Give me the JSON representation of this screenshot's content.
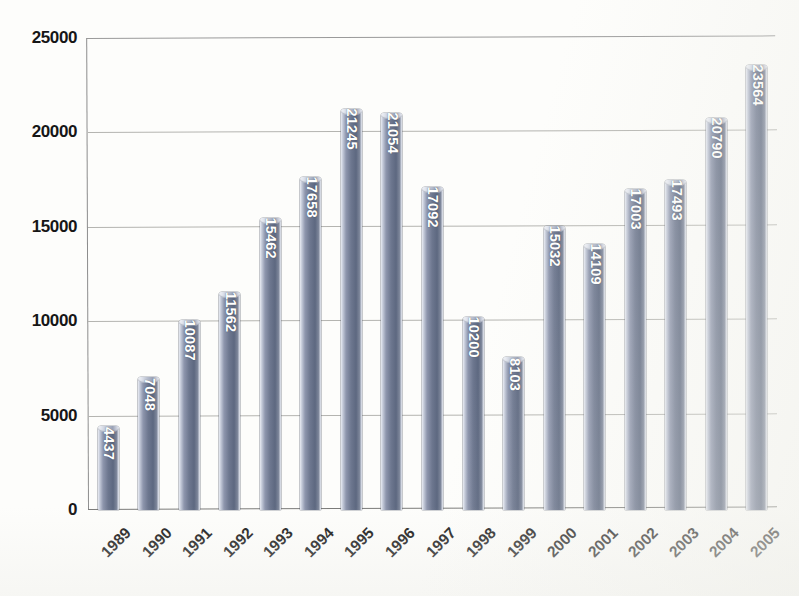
{
  "chart_data": {
    "type": "bar",
    "title": "",
    "subtitle": "",
    "xlabel": "",
    "ylabel": "",
    "categories": [
      "1989",
      "1990",
      "1991",
      "1992",
      "1993",
      "1994",
      "1995",
      "1996",
      "1997",
      "1998",
      "1999",
      "2000",
      "2001",
      "2002",
      "2003",
      "2004",
      "2005"
    ],
    "values": [
      4437,
      7048,
      10087,
      11562,
      15462,
      17658,
      21245,
      21054,
      17092,
      10200,
      8103,
      15032,
      14109,
      17003,
      17493,
      20790,
      23564
    ],
    "value_labels": [
      "4437",
      "7048",
      "10087",
      "11562",
      "15462",
      "17658",
      "21245",
      "21054",
      "17092",
      "10200",
      "8103",
      "15032",
      "14109",
      "17003",
      "17493",
      "20790",
      "23564"
    ],
    "ylim": [
      0,
      25000
    ],
    "ytick_values": [
      0,
      5000,
      10000,
      15000,
      20000,
      25000
    ],
    "ytick_labels": [
      "0",
      "5000",
      "10000",
      "15000",
      "20000",
      "25000"
    ],
    "grid": true,
    "grid_axis": "y",
    "legend": false,
    "legend_position": "none",
    "data_labels_inside_bars": true,
    "data_label_rotation_deg": 90,
    "xtick_rotation_deg": -45,
    "series": [
      {
        "name": "",
        "values": [
          4437,
          7048,
          10087,
          11562,
          15462,
          17658,
          21245,
          21054,
          17092,
          10200,
          8103,
          15032,
          14109,
          17003,
          17493,
          20790,
          23564
        ]
      }
    ]
  },
  "style": {
    "bar_fill_light": "#c3c9d8",
    "bar_fill_mid": "#6d778f",
    "bar_fill_dark": "#5d6880",
    "bar_cap": "#b6bdcd",
    "gridline_color": "#b4b4b0",
    "axis_color": "#8d8d8d",
    "background": "#fdfdfb",
    "label_text_color": "#ffffff",
    "tick_text_color": "#161616"
  }
}
